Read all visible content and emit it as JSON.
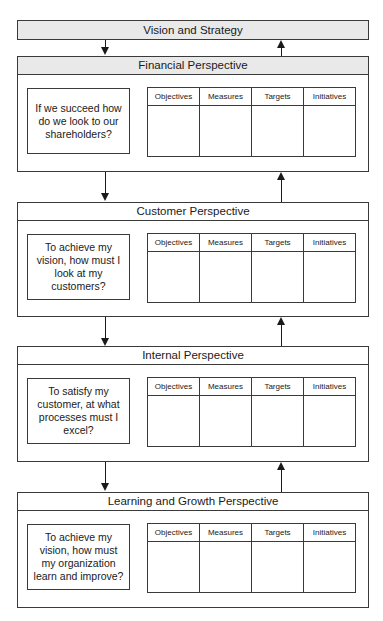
{
  "diagram": {
    "top_box": "Vision and Strategy",
    "columns": [
      "Objectives",
      "Measures",
      "Targets",
      "Initiatives"
    ],
    "perspectives": [
      {
        "title": "Financial Perspective",
        "question": "If we succeed how do we look to our shareholders?",
        "shaded_header": true
      },
      {
        "title": "Customer Perspective",
        "question": "To achieve my vision, how must I look at my customers?",
        "shaded_header": false
      },
      {
        "title": "Internal Perspective",
        "question": "To satisfy my customer, at what processes must I excel?",
        "shaded_header": false
      },
      {
        "title": "Learning and Growth Perspective",
        "question": "To achieve my vision, how must my organization learn and improve?",
        "shaded_header": false
      }
    ],
    "connectors": "Each level connected by a down arrow (left) and an up arrow (right)"
  }
}
